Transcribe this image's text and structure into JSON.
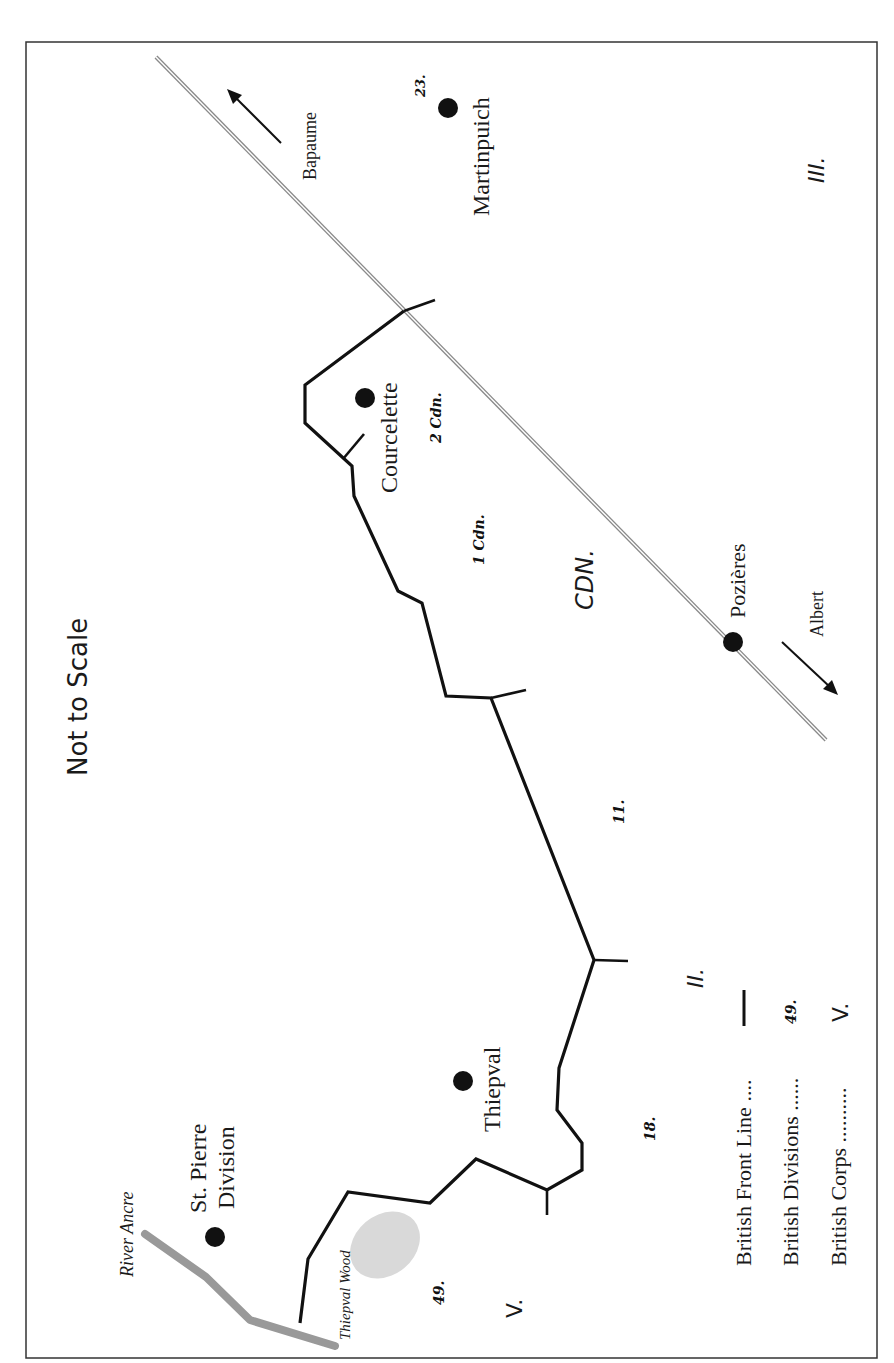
{
  "map": {
    "scale_note": "Not to Scale",
    "colors": {
      "frame": "#333333",
      "front_line": "#111111",
      "road": "#9a9a9a",
      "river": "#999999",
      "wood": "#d9d9d9",
      "town": "#111111"
    },
    "towns": [
      {
        "name": "Martinpuich",
        "x": 448,
        "y": 108
      },
      {
        "name": "Courcelette",
        "x": 365,
        "y": 398
      },
      {
        "name": "Pozières",
        "x": 733,
        "y": 642
      },
      {
        "name": "Thiepval",
        "x": 463,
        "y": 1081
      },
      {
        "name": "St. Pierre Division",
        "line1": "St. Pierre",
        "line2": "Division",
        "x": 215,
        "y": 1237
      }
    ],
    "road": {
      "from": "Bapaume",
      "to": "Albert",
      "arrow_bapaume": "Bapaume",
      "arrow_albert": "Albert"
    },
    "features": {
      "river": "River Ancre",
      "wood": "Thiepval Wood"
    },
    "divisions": [
      "23.",
      "2 Cdn.",
      "1 Cdn.",
      "11.",
      "18.",
      "49."
    ],
    "corps": [
      "III.",
      "CDN.",
      "II.",
      "V."
    ],
    "legend": {
      "front_line": "British Front Line ....",
      "divisions": "British Divisions ......",
      "divisions_sample": "49.",
      "corps": "British Corps ..........",
      "corps_sample": "V."
    }
  }
}
